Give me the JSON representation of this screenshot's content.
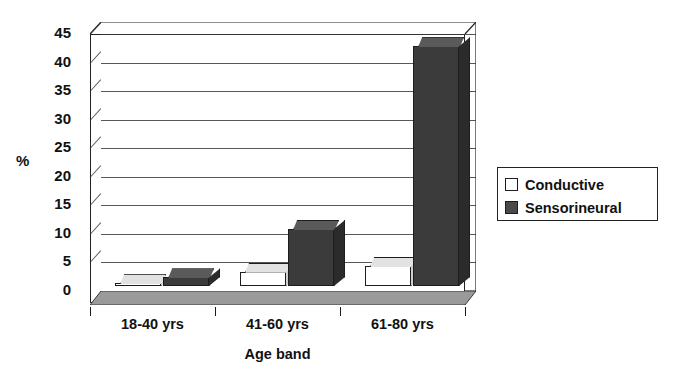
{
  "chart_data": {
    "type": "bar",
    "title": "",
    "subtitle": "",
    "xlabel": "Age band",
    "ylabel": "%",
    "categories": [
      "18-40 yrs",
      "41-60 yrs",
      "61-80 yrs"
    ],
    "series": [
      {
        "name": "Conductive",
        "values": [
          0.5,
          2.5,
          3.5
        ]
      },
      {
        "name": "Sensorineural",
        "values": [
          1.5,
          10.0,
          42.0
        ]
      }
    ],
    "ylim": [
      0,
      45
    ],
    "ytick_step": 5,
    "yticks": [
      0,
      5,
      10,
      15,
      20,
      25,
      30,
      35,
      40,
      45
    ],
    "ytick_labels": [
      "0",
      "5",
      "10",
      "15",
      "20",
      "25",
      "30",
      "35",
      "40",
      "45"
    ],
    "grid": true,
    "grid_axis": "y",
    "legend": [
      "Conductive",
      "Sensorineural"
    ],
    "legend_position": "right",
    "style": "3d-column",
    "colors": {
      "conductive": "#ffffff",
      "sensorineural": "#3b3b3b",
      "axis": "#1a1a1a",
      "grid": "#3a3a3a",
      "floor": "#9a9a9a",
      "background": "#ffffff"
    }
  },
  "legend_box": {
    "items": [
      {
        "label": "Conductive",
        "swatch": "empty-square-icon"
      },
      {
        "label": "Sensorineural",
        "swatch": "filled-square-icon"
      }
    ]
  },
  "axes": {
    "y_axis_title": "%",
    "x_axis_title": "Age band"
  }
}
